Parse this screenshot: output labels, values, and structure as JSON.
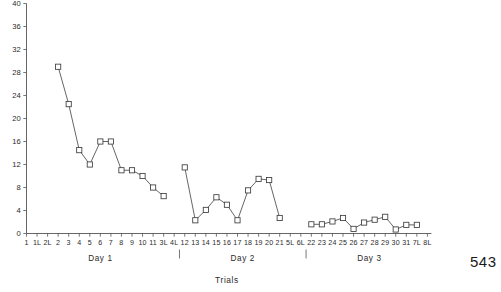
{
  "page": {
    "page_number": "543"
  },
  "chart_data": {
    "type": "line",
    "title": "",
    "xlabel": "Trials",
    "ylabel": "",
    "ylim": [
      0,
      40
    ],
    "y_ticks": [
      0,
      4,
      8,
      12,
      16,
      20,
      24,
      28,
      32,
      36,
      40
    ],
    "y_tick_labels": [
      "0",
      "4",
      "8",
      "12",
      "16",
      "20",
      "24",
      "28",
      "32",
      "36",
      "40"
    ],
    "grid": false,
    "legend": "none",
    "marker": "open-square",
    "x_tick_labels": [
      "1",
      "1L",
      "2L",
      "2",
      "3",
      "4",
      "5",
      "6",
      "7",
      "8",
      "9",
      "10",
      "11",
      "3L",
      "4L",
      "12",
      "13",
      "14",
      "15",
      "16",
      "17",
      "18",
      "19",
      "20",
      "21",
      "5L",
      "6L",
      "22",
      "23",
      "24",
      "25",
      "26",
      "27",
      "28",
      "29",
      "30",
      "31",
      "7L",
      "8L"
    ],
    "group_labels": [
      "Day 1",
      "Day 2",
      "Day 3"
    ],
    "series": [
      {
        "name": "Day 1",
        "categories": [
          "2",
          "3",
          "4",
          "5",
          "6",
          "7",
          "8",
          "9",
          "10",
          "11",
          "3L"
        ],
        "values": [
          29,
          22.5,
          14.5,
          12,
          16,
          16,
          11,
          11,
          10,
          8,
          6.5
        ]
      },
      {
        "name": "Day 2",
        "categories": [
          "12",
          "13",
          "14",
          "15",
          "16",
          "17",
          "18",
          "19",
          "20",
          "21"
        ],
        "values": [
          11.5,
          2.3,
          4.1,
          6.3,
          5,
          2.3,
          7.5,
          9.5,
          9.3,
          2.7
        ]
      },
      {
        "name": "Day 3",
        "categories": [
          "22",
          "23",
          "24",
          "25",
          "26",
          "27",
          "28",
          "29",
          "30",
          "31",
          "7L"
        ],
        "values": [
          1.6,
          1.6,
          2.1,
          2.7,
          0.8,
          1.9,
          2.4,
          2.9,
          0.7,
          1.5,
          1.5
        ]
      }
    ]
  }
}
